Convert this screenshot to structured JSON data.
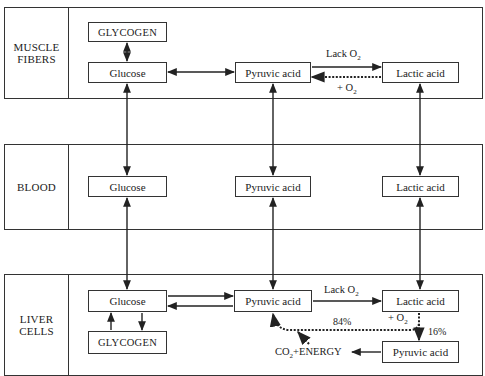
{
  "diagram": {
    "type": "metabolic-pathway",
    "panels": [
      {
        "id": "muscle",
        "label_line1": "MUSCLE",
        "label_line2": "FIBERS",
        "nodes": {
          "glycogen": "GLYCOGEN",
          "glucose": "Glucose",
          "pyruvic": "Pyruvic acid",
          "lactic": "Lactic acid"
        },
        "edge_labels": {
          "lack_o2_text": "Lack O",
          "lack_o2_sub": "2",
          "plus_o2_text": "+ O",
          "plus_o2_sub": "2"
        }
      },
      {
        "id": "blood",
        "label_line1": "BLOOD",
        "nodes": {
          "glucose": "Glucose",
          "pyruvic": "Pyruvic acid",
          "lactic": "Lactic acid"
        }
      },
      {
        "id": "liver",
        "label_line1": "LIVER",
        "label_line2": "CELLS",
        "nodes": {
          "glucose": "Glucose",
          "glycogen": "GLYCOGEN",
          "pyruvic": "Pyruvic acid",
          "lactic": "Lactic acid",
          "pyruvic2": "Pyruvic acid"
        },
        "edge_labels": {
          "lack_o2_text": "Lack O",
          "lack_o2_sub": "2",
          "plus_o2_text": "+ O",
          "plus_o2_sub": "2",
          "pct_84": "84%",
          "pct_16": "16%",
          "co2_text": "CO",
          "co2_sub": "2",
          "energy_text": "+ENERGY"
        }
      }
    ],
    "edges": [
      {
        "from": "muscle.glycogen",
        "to": "muscle.glucose",
        "style": "solid",
        "dir": "both"
      },
      {
        "from": "muscle.glucose",
        "to": "muscle.pyruvic",
        "style": "solid",
        "dir": "both"
      },
      {
        "from": "muscle.pyruvic",
        "to": "muscle.lactic",
        "style": "solid",
        "label": "Lack O2"
      },
      {
        "from": "muscle.lactic",
        "to": "muscle.pyruvic",
        "style": "dotted",
        "label": "+ O2"
      },
      {
        "from": "muscle.glucose",
        "to": "blood.glucose",
        "style": "solid",
        "dir": "both"
      },
      {
        "from": "muscle.pyruvic",
        "to": "blood.pyruvic",
        "style": "solid",
        "dir": "both"
      },
      {
        "from": "muscle.lactic",
        "to": "blood.lactic",
        "style": "solid",
        "dir": "both"
      },
      {
        "from": "blood.glucose",
        "to": "liver.glucose",
        "style": "solid",
        "dir": "both"
      },
      {
        "from": "blood.pyruvic",
        "to": "liver.pyruvic",
        "style": "solid",
        "dir": "both"
      },
      {
        "from": "blood.lactic",
        "to": "liver.lactic",
        "style": "solid",
        "dir": "both"
      },
      {
        "from": "liver.glucose",
        "to": "liver.pyruvic",
        "style": "solid"
      },
      {
        "from": "liver.pyruvic",
        "to": "liver.glucose",
        "style": "solid"
      },
      {
        "from": "liver.glycogen",
        "to": "liver.glucose",
        "style": "solid"
      },
      {
        "from": "liver.glucose",
        "to": "liver.glycogen",
        "style": "solid"
      },
      {
        "from": "liver.pyruvic",
        "to": "liver.lactic",
        "style": "solid",
        "label": "Lack O2"
      },
      {
        "from": "liver.lactic",
        "to": "liver.pyruvic",
        "style": "dotted",
        "label": "+ O2, 84%"
      },
      {
        "from": "liver.lactic",
        "to": "liver.pyruvic2",
        "style": "dotted",
        "label": "16%"
      },
      {
        "from": "liver.pyruvic2",
        "to": "CO2+ENERGY",
        "style": "solid"
      },
      {
        "from": "CO2+ENERGY",
        "to": "liver.pyruvic",
        "style": "dotted"
      }
    ]
  },
  "colors": {
    "line": "#333333",
    "background": "#ffffff"
  }
}
